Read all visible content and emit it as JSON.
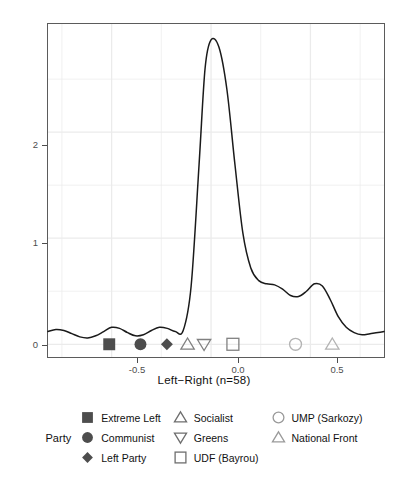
{
  "chart_data": {
    "type": "line",
    "title": "",
    "xlabel": "Left−Right (n=58)",
    "ylabel": "Density",
    "xlim": [
      -0.82,
      0.87
    ],
    "ylim": [
      -0.12,
      3.02
    ],
    "xticks": [
      -0.5,
      0.0,
      0.5
    ],
    "xticklabels": [
      "-0.5",
      "0.0",
      "0.5"
    ],
    "yticks": [
      0,
      1,
      2
    ],
    "yticklabels": [
      "0",
      "1",
      "2"
    ],
    "grid": true,
    "legend_position": "bottom",
    "series": [
      {
        "name": "density",
        "x": [
          -0.82,
          -0.78,
          -0.74,
          -0.7,
          -0.66,
          -0.62,
          -0.58,
          -0.54,
          -0.5,
          -0.46,
          -0.42,
          -0.38,
          -0.34,
          -0.3,
          -0.26,
          -0.22,
          -0.18,
          -0.14,
          -0.1,
          -0.06,
          -0.03,
          0.0,
          0.04,
          0.08,
          0.12,
          0.16,
          0.2,
          0.24,
          0.28,
          0.32,
          0.36,
          0.4,
          0.44,
          0.48,
          0.52,
          0.56,
          0.6,
          0.64,
          0.68,
          0.72,
          0.76,
          0.8,
          0.84,
          0.87
        ],
        "y": [
          0.12,
          0.14,
          0.13,
          0.1,
          0.07,
          0.06,
          0.08,
          0.12,
          0.16,
          0.15,
          0.11,
          0.08,
          0.09,
          0.13,
          0.16,
          0.15,
          0.12,
          0.13,
          0.55,
          1.7,
          2.6,
          2.87,
          2.8,
          2.4,
          1.7,
          1.05,
          0.72,
          0.6,
          0.57,
          0.56,
          0.52,
          0.46,
          0.45,
          0.5,
          0.57,
          0.55,
          0.42,
          0.26,
          0.16,
          0.11,
          0.09,
          0.1,
          0.11,
          0.12
        ]
      }
    ],
    "points": [
      {
        "party": "Extreme Left",
        "x": -0.512,
        "y": 0,
        "shape": "square-filled",
        "color": "#4d4d4d"
      },
      {
        "party": "Communist",
        "x": -0.355,
        "y": 0,
        "shape": "circle-filled",
        "color": "#4d4d4d"
      },
      {
        "party": "Left Party",
        "x": -0.222,
        "y": 0,
        "shape": "diamond-filled",
        "color": "#4d4d4d"
      },
      {
        "party": "Socialist",
        "x": -0.118,
        "y": 0,
        "shape": "triangle-open",
        "color": "#808080"
      },
      {
        "party": "Greens",
        "x": -0.035,
        "y": 0,
        "shape": "triangle-down-open",
        "color": "#808080"
      },
      {
        "party": "UDF (Bayrou)",
        "x": 0.11,
        "y": 0,
        "shape": "square-open",
        "color": "#808080"
      },
      {
        "party": "UMP (Sarkozy)",
        "x": 0.425,
        "y": 0,
        "shape": "circle-open",
        "color": "#b3b3b3"
      },
      {
        "party": "National Front",
        "x": 0.61,
        "y": 0,
        "shape": "triangle-open",
        "color": "#b3b3b3"
      }
    ]
  },
  "axis": {
    "x_title": "Left−Right (n=58)",
    "y_title": "Density",
    "x_ticks": [
      "-0.5",
      "0.0",
      "0.5"
    ],
    "y_ticks": [
      "0",
      "1",
      "2"
    ]
  },
  "legend": {
    "title": "Party",
    "columns": [
      [
        {
          "label": "Extreme Left",
          "shape": "square-filled",
          "color": "#4d4d4d"
        },
        {
          "label": "Communist",
          "shape": "circle-filled",
          "color": "#4d4d4d"
        },
        {
          "label": "Left Party",
          "shape": "diamond-filled",
          "color": "#4d4d4d"
        }
      ],
      [
        {
          "label": "Socialist",
          "shape": "triangle-open",
          "color": "#6e6e6e"
        },
        {
          "label": "Greens",
          "shape": "triangle-down-open",
          "color": "#6e6e6e"
        },
        {
          "label": "UDF (Bayrou)",
          "shape": "square-open",
          "color": "#6e6e6e"
        }
      ],
      [
        {
          "label": "UMP (Sarkozy)",
          "shape": "circle-open",
          "color": "#9a9a9a"
        },
        {
          "label": "National Front",
          "shape": "triangle-open",
          "color": "#9a9a9a"
        }
      ]
    ]
  },
  "style": {
    "panel_border": "#5b5b5b",
    "grid_color": "#ebebeb",
    "curve_color": "#1a1a1a",
    "tick_text": "#4d4d4d",
    "title_text": "#111111",
    "background": "#ffffff"
  }
}
